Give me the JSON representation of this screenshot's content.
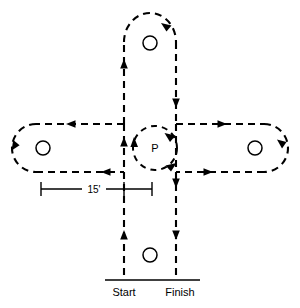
{
  "diagram": {
    "type": "driving-course-diagram",
    "background_color": "#ffffff",
    "line_color": "#000000",
    "labels": {
      "start": "Start",
      "finish": "Finish",
      "pivot": "P",
      "dimension": "15'"
    },
    "cones": [
      {
        "name": "top-cone",
        "cx": 150,
        "cy": 43,
        "r": 7
      },
      {
        "name": "left-cone",
        "cx": 43,
        "cy": 148,
        "r": 7
      },
      {
        "name": "right-cone",
        "cx": 255,
        "cy": 148,
        "r": 7
      },
      {
        "name": "bottom-cone",
        "cx": 150,
        "cy": 255,
        "r": 7
      }
    ],
    "corridor": {
      "vertical_left_x": 124,
      "vertical_right_x": 176,
      "horizontal_top_y": 124,
      "horizontal_bottom_y": 172,
      "top_arc_y": 13,
      "left_arc_x": 13,
      "right_arc_x": 288,
      "baseline_y": 280
    },
    "pivot_loop": {
      "cx": 155,
      "cy": 148,
      "r": 22
    },
    "dimension_line": {
      "y": 189,
      "x_start": 41,
      "x_end": 152,
      "value": "15'"
    },
    "baseline": {
      "x_start": 105,
      "x_end": 200,
      "y": 280
    }
  }
}
